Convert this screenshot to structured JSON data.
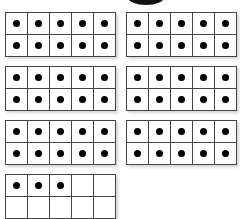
{
  "diagram": {
    "type": "ten-frames",
    "colors": {
      "line": "#444444",
      "dot": "#000000",
      "background": "#ffffff"
    },
    "frames": [
      {
        "id": 1,
        "x": 5,
        "y": 12,
        "filled": 10
      },
      {
        "id": 2,
        "x": 126,
        "y": 12,
        "filled": 10
      },
      {
        "id": 3,
        "x": 5,
        "y": 66,
        "filled": 10
      },
      {
        "id": 4,
        "x": 126,
        "y": 66,
        "filled": 10
      },
      {
        "id": 5,
        "x": 5,
        "y": 120,
        "filled": 10
      },
      {
        "id": 6,
        "x": 126,
        "y": 120,
        "filled": 10
      },
      {
        "id": 7,
        "x": 5,
        "y": 174,
        "filled": 3
      }
    ],
    "total_dots": 63
  }
}
